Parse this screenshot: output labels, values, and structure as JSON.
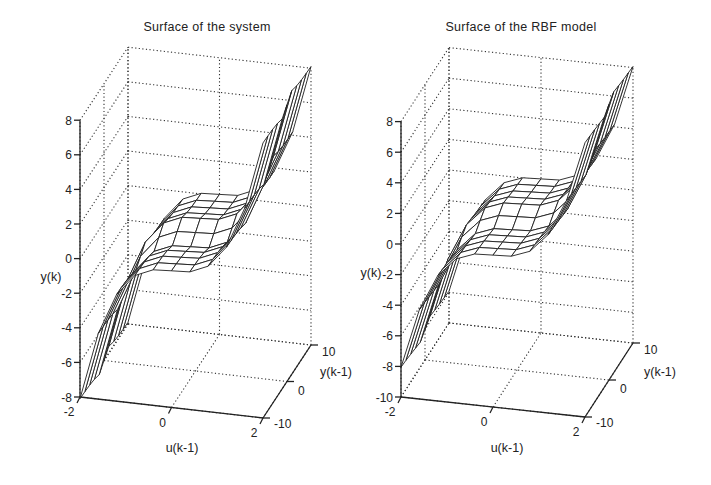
{
  "figure": {
    "background": "#ffffff",
    "ink": "#1e1e1e"
  },
  "chart_data": [
    {
      "type": "surface",
      "title": "Surface of the system",
      "xlabel": "u(k-1)",
      "ylabel": "y(k-1)",
      "zlabel": "y(k)",
      "xlim": [
        -2,
        2
      ],
      "ylim": [
        -10,
        10
      ],
      "zlim": [
        -8,
        8
      ],
      "xticks": [
        -2,
        0,
        2
      ],
      "yticks": [
        -10,
        0,
        10
      ],
      "zticks": [
        -8,
        -6,
        -4,
        -2,
        0,
        2,
        4,
        6,
        8
      ],
      "grid": true,
      "projection": {
        "origin": [
          80,
          397
        ],
        "u_vec": [
          183,
          21
        ],
        "v_vec": [
          48,
          -73
        ],
        "z_scale": 17.3
      },
      "title_pos": [
        207,
        31
      ],
      "zlabel_pos": [
        51,
        281
      ],
      "xlabel_pos": [
        182,
        452
      ],
      "ylabel_pos": [
        320,
        376
      ],
      "x": [
        -2,
        -1.6,
        -1.2,
        -0.8,
        -0.4,
        0,
        0.4,
        0.8,
        1.2,
        1.6,
        2
      ],
      "y": [
        -10,
        -8,
        -6,
        -4,
        -2,
        0,
        2,
        4,
        6,
        8,
        10
      ],
      "z": [
        [
          -8.1,
          -8.12,
          -8.16,
          -8.24,
          -8.4,
          -8.0,
          -7.6,
          -7.76,
          -7.84,
          -7.88,
          -7.9
        ],
        [
          -4.2,
          -4.22,
          -4.26,
          -4.34,
          -4.5,
          -4.1,
          -3.7,
          -3.86,
          -3.94,
          -3.98,
          -4.0
        ],
        [
          -1.83,
          -1.85,
          -1.89,
          -1.97,
          -2.13,
          -1.73,
          -1.33,
          -1.49,
          -1.57,
          -1.61,
          -1.63
        ],
        [
          -0.61,
          -0.63,
          -0.67,
          -0.75,
          -0.91,
          -0.51,
          -0.11,
          -0.27,
          -0.35,
          -0.39,
          -0.41
        ],
        [
          -0.16,
          -0.18,
          -0.22,
          -0.3,
          -0.46,
          -0.06,
          0.34,
          0.18,
          0.1,
          0.06,
          0.04
        ],
        [
          -0.1,
          -0.12,
          -0.16,
          -0.24,
          -0.4,
          0.0,
          0.4,
          0.24,
          0.16,
          0.12,
          0.1
        ],
        [
          -0.04,
          -0.06,
          -0.1,
          -0.18,
          -0.34,
          0.06,
          0.46,
          0.3,
          0.22,
          0.18,
          0.16
        ],
        [
          0.41,
          0.39,
          0.35,
          0.27,
          0.11,
          0.51,
          0.91,
          0.75,
          0.67,
          0.63,
          0.61
        ],
        [
          1.63,
          1.61,
          1.57,
          1.49,
          1.33,
          1.73,
          2.13,
          1.97,
          1.89,
          1.85,
          1.83
        ],
        [
          4.0,
          3.98,
          3.94,
          3.86,
          3.7,
          4.1,
          4.5,
          4.34,
          4.26,
          4.22,
          4.2
        ],
        [
          7.9,
          7.88,
          7.84,
          7.76,
          7.6,
          8.0,
          8.4,
          8.24,
          8.16,
          8.12,
          8.1
        ]
      ]
    },
    {
      "type": "surface",
      "title": "Surface of the RBF model",
      "xlabel": "u(k-1)",
      "ylabel": "y(k-1)",
      "zlabel": "y(k)",
      "xlim": [
        -2,
        2
      ],
      "ylim": [
        -10,
        10
      ],
      "zlim": [
        -10,
        8
      ],
      "xticks": [
        -2,
        0,
        2
      ],
      "yticks": [
        -10,
        0,
        10
      ],
      "zticks": [
        -10,
        -8,
        -6,
        -4,
        -2,
        0,
        2,
        4,
        6,
        8
      ],
      "grid": true,
      "projection": {
        "origin": [
          401,
          397
        ],
        "u_vec": [
          184,
          20
        ],
        "v_vec": [
          48,
          -74
        ],
        "z_scale": 15.3
      },
      "title_pos": [
        521,
        31
      ],
      "zlabel_pos": [
        371,
        277
      ],
      "xlabel_pos": [
        507,
        452
      ],
      "ylabel_pos": [
        644,
        376
      ],
      "x": [
        -2,
        -1.6,
        -1.2,
        -0.8,
        -0.4,
        0,
        0.4,
        0.8,
        1.2,
        1.6,
        2
      ],
      "y": [
        -10,
        -8,
        -6,
        -4,
        -2,
        0,
        2,
        4,
        6,
        8,
        10
      ],
      "z": [
        [
          -8.05,
          -8.1,
          -8.18,
          -8.27,
          -8.36,
          -8.02,
          -7.64,
          -7.72,
          -7.8,
          -7.86,
          -7.92
        ],
        [
          -4.16,
          -4.21,
          -4.28,
          -4.37,
          -4.46,
          -4.07,
          -3.74,
          -3.83,
          -3.91,
          -3.97,
          -4.03
        ],
        [
          -1.8,
          -1.86,
          -1.92,
          -2.0,
          -2.08,
          -1.7,
          -1.37,
          -1.46,
          -1.55,
          -1.6,
          -1.66
        ],
        [
          -0.58,
          -0.64,
          -0.7,
          -0.78,
          -0.86,
          -0.49,
          -0.15,
          -0.24,
          -0.33,
          -0.38,
          -0.44
        ],
        [
          -0.13,
          -0.19,
          -0.25,
          -0.33,
          -0.41,
          -0.04,
          0.3,
          0.21,
          0.12,
          0.07,
          0.01
        ],
        [
          -0.07,
          -0.13,
          -0.19,
          -0.27,
          -0.35,
          0.02,
          0.36,
          0.27,
          0.18,
          0.13,
          0.07
        ],
        [
          -0.01,
          -0.07,
          -0.13,
          -0.21,
          -0.29,
          0.08,
          0.42,
          0.33,
          0.24,
          0.19,
          0.13
        ],
        [
          0.44,
          0.38,
          0.32,
          0.24,
          0.16,
          0.53,
          0.87,
          0.78,
          0.69,
          0.64,
          0.58
        ],
        [
          1.66,
          1.6,
          1.54,
          1.46,
          1.38,
          1.75,
          2.09,
          2.0,
          1.91,
          1.86,
          1.8
        ],
        [
          4.03,
          3.97,
          3.91,
          3.83,
          3.75,
          4.12,
          4.46,
          4.37,
          4.28,
          4.23,
          4.17
        ],
        [
          7.93,
          7.87,
          7.81,
          7.73,
          7.65,
          8.02,
          8.36,
          8.27,
          8.18,
          8.13,
          8.07
        ]
      ]
    }
  ]
}
